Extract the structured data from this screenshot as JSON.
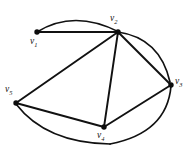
{
  "figure": {
    "background_color": "#ffffff",
    "stroke_color": "#111111",
    "width": 191,
    "height": 153
  },
  "graph": {
    "vertices": [
      {
        "id": "v1",
        "label": "v",
        "subscript": "1",
        "x": 37,
        "y": 32,
        "label_x": 30,
        "label_y": 38
      },
      {
        "id": "v2",
        "label": "v",
        "subscript": "2",
        "x": 118,
        "y": 32,
        "label_x": 111,
        "label_y": 16
      },
      {
        "id": "v3",
        "label": "v",
        "subscript": "3",
        "x": 171,
        "y": 85,
        "label_x": 174,
        "label_y": 79
      },
      {
        "id": "v4",
        "label": "v",
        "subscript": "4",
        "x": 104,
        "y": 127,
        "label_x": 97,
        "label_y": 132
      },
      {
        "id": "v5",
        "label": "v",
        "subscript": "5",
        "x": 16,
        "y": 103,
        "label_x": 6,
        "label_y": 87
      }
    ],
    "straight_edges": [
      {
        "from": "v1",
        "to": "v2"
      },
      {
        "from": "v2",
        "to": "v5"
      },
      {
        "from": "v2",
        "to": "v4"
      },
      {
        "from": "v2",
        "to": "v3"
      },
      {
        "from": "v5",
        "to": "v4"
      },
      {
        "from": "v4",
        "to": "v3"
      }
    ],
    "curved_edges": [
      {
        "from": "v1",
        "to": "v2",
        "position": "top",
        "path": "M 37 32 Q 74 10 118 32"
      },
      {
        "from": "v2",
        "to": "v3",
        "position": "right-upper",
        "path": "M 118 32 Q 168 40 171 85"
      },
      {
        "from": "v3",
        "to": "v4",
        "position": "bottom-right",
        "path": "M 171 85 Q 163 136 104 144"
      },
      {
        "from": "v4",
        "to": "v5",
        "position": "bottom-left",
        "path": "M 104 144 Q 47 141 16 103"
      }
    ]
  }
}
